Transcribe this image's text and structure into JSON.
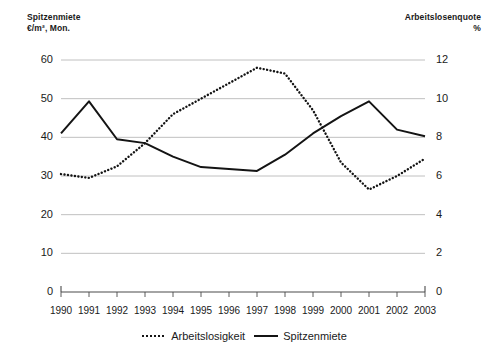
{
  "left_axis": {
    "title": "Spitzenmiete\n€/m², Mon.",
    "ticks": [
      "60",
      "50",
      "40",
      "30",
      "20",
      "10",
      "0"
    ]
  },
  "right_axis": {
    "title": "Arbeitslosenquote\n%",
    "ticks": [
      "12",
      "10",
      "8",
      "6",
      "4",
      "2",
      "0"
    ]
  },
  "legend": {
    "items": [
      {
        "label": "Arbeitslosigkeit",
        "style": "dotted"
      },
      {
        "label": "Spitzenmiete",
        "style": "solid"
      }
    ]
  },
  "chart_data": {
    "type": "line",
    "title": "",
    "xlabel": "",
    "grid": true,
    "legend_position": "bottom-center",
    "categories": [
      "1990",
      "1991",
      "1992",
      "1993",
      "1994",
      "1995",
      "1996",
      "1997",
      "1998",
      "1999",
      "2000",
      "2001",
      "2002",
      "2003"
    ],
    "axes": {
      "left": {
        "label": "Spitzenmiete €/m², Mon.",
        "ylim": [
          0,
          60
        ],
        "ticks": [
          0,
          10,
          20,
          30,
          40,
          50,
          60
        ],
        "unit": "€/m², Mon."
      },
      "right": {
        "label": "Arbeitslosenquote %",
        "ylim": [
          0,
          12
        ],
        "ticks": [
          0,
          2,
          4,
          6,
          8,
          10,
          12
        ],
        "unit": "%"
      }
    },
    "series": [
      {
        "name": "Arbeitslosigkeit",
        "axis": "right",
        "style": "dotted",
        "color": "#141414",
        "values": [
          6.1,
          5.9,
          6.5,
          7.7,
          9.2,
          10.0,
          10.8,
          11.6,
          11.3,
          9.4,
          6.7,
          5.3,
          6.0,
          6.9
        ]
      },
      {
        "name": "Spitzenmiete",
        "axis": "left",
        "style": "solid",
        "color": "#141414",
        "values": [
          41.0,
          49.3,
          39.5,
          38.5,
          35.0,
          32.3,
          31.8,
          31.3,
          35.5,
          41.0,
          45.5,
          49.3,
          42.0,
          40.3
        ]
      }
    ]
  },
  "colors": {
    "ink": "#141414",
    "grid": "#b9b9b9",
    "axis": "#4a4a4a",
    "background": "#ffffff"
  }
}
